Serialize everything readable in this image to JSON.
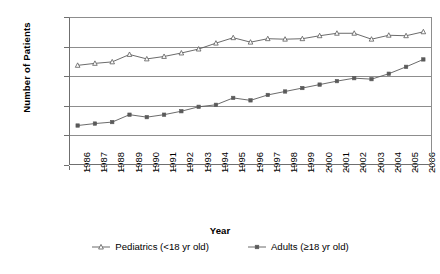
{
  "chart_data": {
    "type": "line",
    "title": "",
    "xlabel": "Year",
    "ylabel": "Number of Patients",
    "grid": true,
    "legend_position": "bottom",
    "ylim": [
      0,
      15000
    ],
    "yticks": [
      "0",
      "3000",
      "6000",
      "9000",
      "12,000",
      "15,000"
    ],
    "ytick_values": [
      0,
      3000,
      6000,
      9000,
      12000,
      15000
    ],
    "categories": [
      "1986",
      "1987",
      "1988",
      "1989",
      "1990",
      "1991",
      "1992",
      "1993",
      "1994",
      "1995",
      "1996",
      "1997",
      "1998",
      "1999",
      "2000",
      "2001",
      "2002",
      "2003",
      "2004",
      "2005",
      "2006"
    ],
    "series": [
      {
        "name": "Pediatrics (<18 yr old)",
        "marker": "open-triangle",
        "color": "#5a5a5a",
        "values": [
          10100,
          10300,
          10450,
          11200,
          10750,
          11000,
          11350,
          11750,
          12350,
          12900,
          12450,
          12800,
          12750,
          12800,
          13100,
          13350,
          13350,
          12750,
          13150,
          13100,
          13500
        ]
      },
      {
        "name": "Adults (≥18 yr old)",
        "marker": "filled-square",
        "color": "#5a5a5a",
        "values": [
          4000,
          4200,
          4350,
          5100,
          4850,
          5100,
          5450,
          5900,
          6100,
          6800,
          6550,
          7100,
          7450,
          7800,
          8150,
          8500,
          8800,
          8700,
          9250,
          9950,
          10700
        ]
      }
    ]
  },
  "legend": {
    "items": [
      {
        "label": "Pediatrics (<18 yr old)",
        "marker": "open-triangle"
      },
      {
        "label": "Adults (≥18 yr old)",
        "marker": "filled-square"
      }
    ]
  }
}
